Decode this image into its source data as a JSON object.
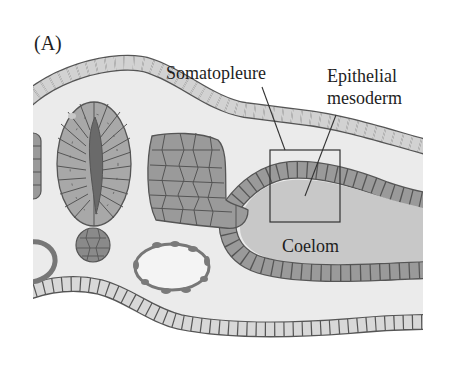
{
  "figure": {
    "panel_label": "(A)",
    "labels": {
      "somatopleure": "Somatopleure",
      "epithelial_mesoderm_line1": "Epithelial",
      "epithelial_mesoderm_line2": "mesoderm",
      "coelom": "Coelom"
    },
    "structures": [
      "ectoderm",
      "neural-tube",
      "neural-tube-lumen",
      "somite",
      "notochord",
      "dorsal-aorta-left",
      "dorsal-aorta-right",
      "somatic-mesoderm",
      "splanchnic-mesoderm",
      "coelom",
      "endoderm",
      "highlight-box"
    ],
    "colors": {
      "background": "#ffffff",
      "tissue_fill": "#ebebeb",
      "ectoderm_cell": "#d2d2d2",
      "mesoderm_cell": "#9a9a9a",
      "neural_tube_cell": "#a8a8a8",
      "lumen": "#6a6a6a",
      "coelom_fill": "#c8c8c8",
      "outline": "#555555",
      "text": "#1e1e1e"
    }
  }
}
